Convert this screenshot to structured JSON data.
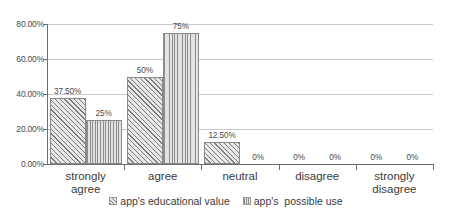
{
  "chart_data": {
    "type": "bar",
    "title": "",
    "subtitle": "",
    "xlabel": "",
    "ylabel": "",
    "categories": [
      "strongly\nagree",
      "agree",
      "neutral",
      "disagree",
      "strongly\ndisagree"
    ],
    "series": [
      {
        "name": "app's educational value",
        "values": [
          37.5,
          50,
          12.5,
          0,
          0
        ],
        "data_labels": [
          "37.50%",
          "50%",
          "12.50%",
          "0%",
          "0%"
        ],
        "pattern": "diagonal-hatch"
      },
      {
        "name": "app's  possible use",
        "values": [
          25,
          75,
          0,
          0,
          0
        ],
        "data_labels": [
          "25%",
          "75%",
          "0%",
          "0%",
          "0%"
        ],
        "pattern": "vertical-lines"
      }
    ],
    "ylim": [
      0,
      80
    ],
    "ytick_values": [
      0,
      20,
      40,
      60,
      80
    ],
    "ytick_labels": [
      "0.00%",
      "20.00%",
      "40.00%",
      "60.00%",
      "80.00%"
    ],
    "grid": true,
    "grid_axis": "y",
    "legend_position": "bottom",
    "colors": {
      "gridline": "#c9c9c9",
      "axis": "#6f6f6f",
      "bar_border": "#8a8a8a",
      "series_1_fill": "#e8e8e8",
      "series_2_fill": "#e3e3e3",
      "text": "#3b3b3b"
    }
  }
}
